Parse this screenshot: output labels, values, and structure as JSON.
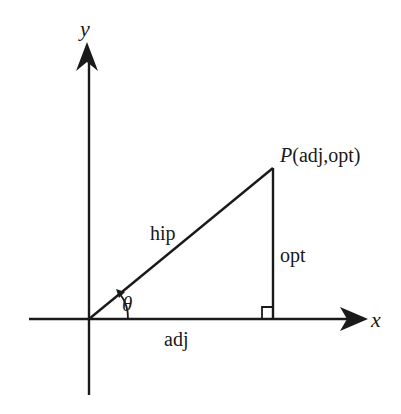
{
  "diagram": {
    "type": "right-triangle-on-axes",
    "axes": {
      "x_label": "x",
      "y_label": "y"
    },
    "point": {
      "name": "P",
      "coords": "(adj,opt)"
    },
    "sides": {
      "hypotenuse": "hip",
      "opposite": "opt",
      "adjacent": "adj"
    },
    "angle": {
      "symbol": "θ"
    },
    "colors": {
      "stroke": "#1a1a1a",
      "background": "#ffffff"
    }
  }
}
